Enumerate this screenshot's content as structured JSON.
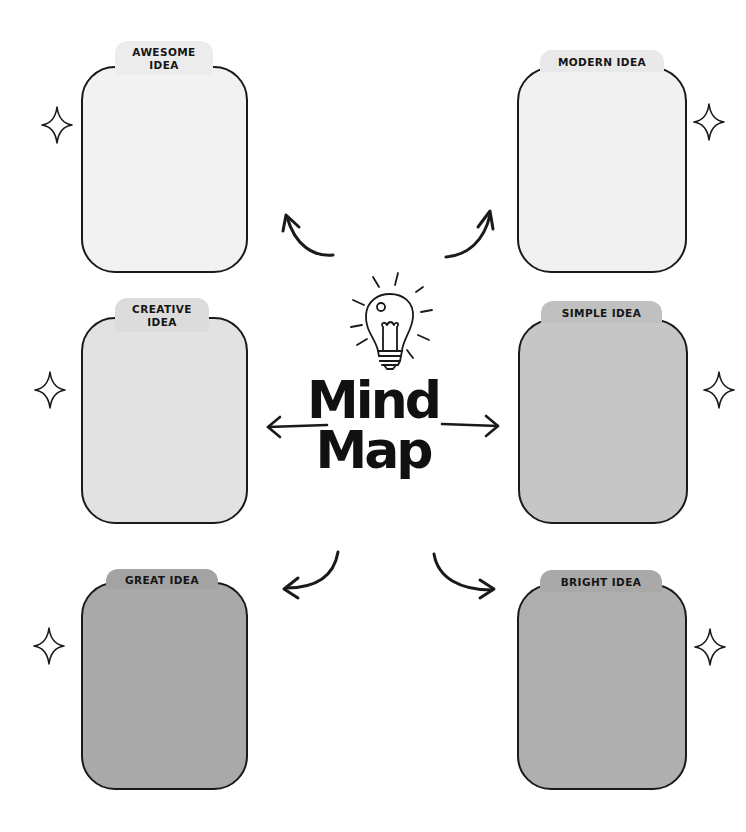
{
  "title": {
    "line1": "Mind",
    "line2": "Map"
  },
  "center_icon": "lightbulb-icon",
  "colors": {
    "border": "#1a1a1a",
    "background": "#ffffff",
    "text": "#151515"
  },
  "boxes": [
    {
      "id": "awesome",
      "label_line1": "AWESOME",
      "label_line2": "IDEA",
      "fill": "#f2f2f2",
      "tab_fill": "#ececec"
    },
    {
      "id": "modern",
      "label_line1": "MODERN IDEA",
      "label_line2": "",
      "fill": "#f1f1f1",
      "tab_fill": "#e9e9e9"
    },
    {
      "id": "creative",
      "label_line1": "CREATIVE",
      "label_line2": "IDEA",
      "fill": "#e2e2e2",
      "tab_fill": "#dcdcdc"
    },
    {
      "id": "simple",
      "label_line1": "SIMPLE IDEA",
      "label_line2": "",
      "fill": "#c6c6c6",
      "tab_fill": "#c0c0c0"
    },
    {
      "id": "great",
      "label_line1": "GREAT IDEA",
      "label_line2": "",
      "fill": "#a9a9a9",
      "tab_fill": "#a3a3a3"
    },
    {
      "id": "bright",
      "label_line1": "BRIGHT IDEA",
      "label_line2": "",
      "fill": "#afafaf",
      "tab_fill": "#a9a9a9"
    }
  ],
  "decorations": {
    "sparkle_icon": "sparkle-icon",
    "arrow_icon": "curved-arrow-icon"
  }
}
